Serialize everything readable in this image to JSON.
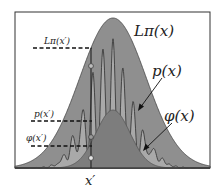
{
  "diagram": {
    "curves": {
      "envelope_label": "Lπ(x)",
      "target_label": "p(x)",
      "proposal_label": "φ(x)"
    },
    "markers": {
      "envelope_at_xprime": "Lπ(x′)",
      "target_at_xprime": "p(x′)",
      "proposal_at_xprime": "φ(x′)",
      "x_axis_point": "x′"
    },
    "colors": {
      "background": "#ffffff",
      "frame": "#333333",
      "envelope_fill": "#8f8f8f",
      "target_fill": "#a9a9a9",
      "proposal_fill": "#7d7d7d",
      "curve_stroke": "#3a3a3a",
      "circle_fill": "#d8d8d8"
    }
  }
}
